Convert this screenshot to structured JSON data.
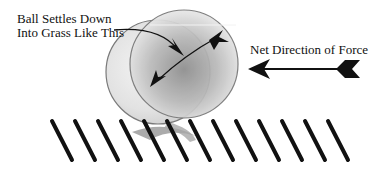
{
  "labels": {
    "settles_line1": "Ball Settles Down",
    "settles_line2": "Into Grass Like This",
    "force": "Net Direction of Force"
  },
  "balls": {
    "ghost": {
      "cx": 158,
      "cy": 72,
      "r": 52
    },
    "main": {
      "cx": 184,
      "cy": 64,
      "r": 54
    }
  },
  "grass": {
    "count": 13,
    "start_x": 52,
    "spacing": 23,
    "top_y": 121,
    "bottom_y": 160,
    "lean_dx": 20
  },
  "colors": {
    "stroke": "#111111",
    "ball_outline": "#777777",
    "ball_light": "#e4e4e4",
    "ball_dark": "#9a9a9a"
  }
}
